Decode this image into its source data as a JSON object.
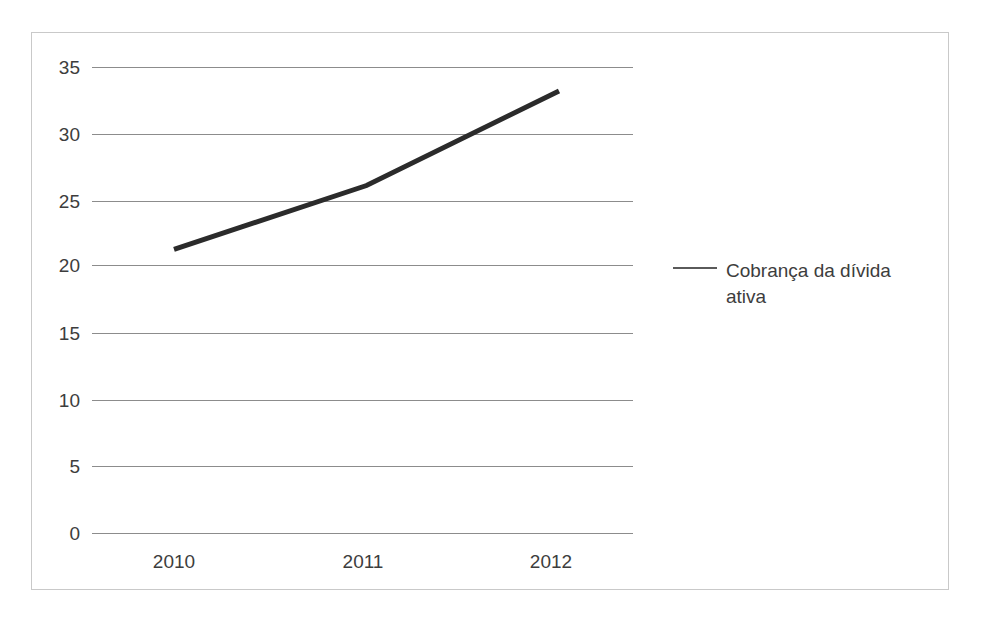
{
  "chart_data": {
    "type": "line",
    "title": "",
    "xlabel": "",
    "ylabel": "",
    "categories": [
      "2010",
      "2011",
      "2012"
    ],
    "series": [
      {
        "name": "Cobrança da dívida ativa",
        "values": [
          21.3,
          26.1,
          33.2
        ],
        "color": "#2b2b2b",
        "line_width": 5
      }
    ],
    "ylim": [
      0,
      35
    ],
    "y_ticks": [
      0,
      5,
      10,
      15,
      20,
      25,
      30,
      35
    ],
    "y_tick_labels": [
      "0",
      "5",
      "10",
      "15",
      "20",
      "25",
      "30",
      "35"
    ],
    "grid": true,
    "grid_color": "#8c8c8c",
    "legend_position": "right",
    "border_color": "#c9c9c9",
    "background": "#ffffff"
  },
  "legend": {
    "entries": [
      {
        "label": "Cobrança da dívida\nativa",
        "swatch": "line-swatch"
      }
    ]
  },
  "axes": {
    "y_labels": [
      "35",
      "30",
      "25",
      "20",
      "15",
      "10",
      "5",
      "0"
    ],
    "x_labels": [
      "2010",
      "2011",
      "2012"
    ]
  }
}
